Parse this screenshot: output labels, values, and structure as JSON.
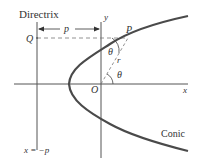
{
  "diagram": {
    "labels": {
      "directrix": "Directrix",
      "y_axis": "y",
      "x_axis": "x",
      "Q": "Q",
      "P": "P",
      "O": "O",
      "p_distance": "p",
      "r": "r",
      "theta_top": "θ",
      "theta_bottom": "θ",
      "conic": "Conic",
      "directrix_eq": "x = −p"
    },
    "colors": {
      "curve": "#4a4a4a",
      "axes": "#555555",
      "dashed": "#777777",
      "text": "#333333"
    }
  }
}
